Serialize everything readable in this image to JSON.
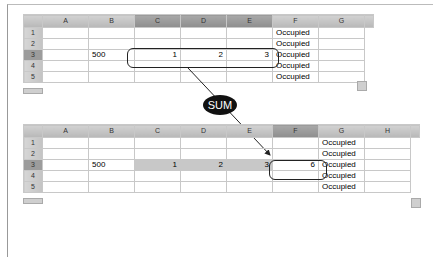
{
  "top_table": {
    "columns": [
      "A",
      "B",
      "C",
      "D",
      "E",
      "F",
      "G"
    ],
    "selected_columns": [
      "C",
      "D",
      "E"
    ],
    "rows": [
      {
        "n": "1",
        "A": "",
        "B": "",
        "C": "",
        "D": "",
        "E": "",
        "F": "Occupied",
        "G": ""
      },
      {
        "n": "2",
        "A": "",
        "B": "",
        "C": "",
        "D": "",
        "E": "",
        "F": "Occupied",
        "G": ""
      },
      {
        "n": "3",
        "A": "",
        "B": "500",
        "C": "1",
        "D": "2",
        "E": "3",
        "F": "Occupied",
        "G": ""
      },
      {
        "n": "4",
        "A": "",
        "B": "",
        "C": "",
        "D": "",
        "E": "",
        "F": "Occupied",
        "G": ""
      },
      {
        "n": "5",
        "A": "",
        "B": "",
        "C": "",
        "D": "",
        "E": "",
        "F": "Occupied",
        "G": ""
      }
    ]
  },
  "callout": {
    "label": "SUM"
  },
  "bottom_table": {
    "columns": [
      "A",
      "B",
      "C",
      "D",
      "E",
      "F",
      "G",
      "H"
    ],
    "selected_columns": [
      "F"
    ],
    "rows": [
      {
        "n": "1",
        "A": "",
        "B": "",
        "C": "",
        "D": "",
        "E": "",
        "F": "",
        "G": "Occupied",
        "H": ""
      },
      {
        "n": "2",
        "A": "",
        "B": "",
        "C": "",
        "D": "",
        "E": "",
        "F": "",
        "G": "Occupied",
        "H": ""
      },
      {
        "n": "3",
        "A": "",
        "B": "500",
        "C": "1",
        "D": "2",
        "E": "3",
        "F": "6",
        "G": "Occupied",
        "H": ""
      },
      {
        "n": "4",
        "A": "",
        "B": "",
        "C": "",
        "D": "",
        "E": "",
        "F": "",
        "G": "Occupied",
        "H": ""
      },
      {
        "n": "5",
        "A": "",
        "B": "",
        "C": "",
        "D": "",
        "E": "",
        "F": "",
        "G": "Occupied",
        "H": ""
      }
    ]
  }
}
